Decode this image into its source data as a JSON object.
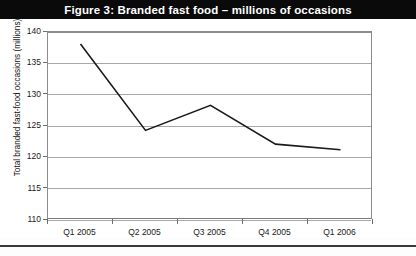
{
  "figure": {
    "title": "Figure 3: Branded fast food – millions of occasions"
  },
  "colors": {
    "header_background": "#0a0a0a",
    "header_text": "#ffffff",
    "plot_background": "#ffffff",
    "gridline": "#a8a8a8",
    "axis": "#8c8c8c",
    "series_line": "#1a1a1a",
    "footer_rule": "#3a3a3a"
  },
  "chart_data": {
    "type": "line",
    "title": "Figure 3: Branded fast food – millions of occasions",
    "xlabel": "",
    "ylabel": "Total branded fast-food occasions (millions)",
    "categories": [
      "Q1 2005",
      "Q2 2005",
      "Q3 2005",
      "Q4 2005",
      "Q1 2006"
    ],
    "values": [
      138.1,
      124.3,
      128.3,
      122.1,
      121.2
    ],
    "series": [
      {
        "name": "Total branded fast-food occasions (millions)",
        "values": [
          138.1,
          124.3,
          128.3,
          122.1,
          121.2
        ]
      }
    ],
    "ylim": [
      110,
      140
    ],
    "ytick_labels": [
      "140",
      "135",
      "130",
      "125",
      "120",
      "115",
      "110"
    ],
    "ytick_values": [
      140,
      135,
      130,
      125,
      120,
      115,
      110
    ],
    "grid": true,
    "grid_axis": "y",
    "legend": false,
    "legend_position": "none",
    "markers": false,
    "annotations": []
  }
}
